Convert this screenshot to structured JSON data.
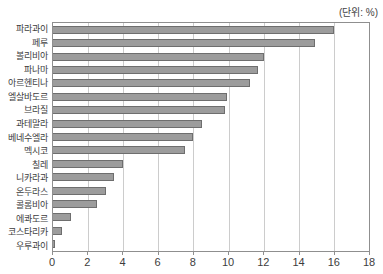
{
  "unit_label": "(단위: %)",
  "colors": {
    "bar_fill": "#9c9c9c",
    "bar_border": "#6e6e6e",
    "gridline": "#cccccc",
    "plot_border": "#8f8f8f",
    "text": "#3d3d3d"
  },
  "chart_data": {
    "type": "bar",
    "orientation": "horizontal",
    "title": "",
    "xlabel": "",
    "ylabel": "",
    "unit": "(단위: %)",
    "categories": [
      "파라과이",
      "페루",
      "볼리비아",
      "파나마",
      "아르헨티나",
      "엘살바도르",
      "브라질",
      "과테말라",
      "베네수엘라",
      "멕시코",
      "칠레",
      "니카라과",
      "온두라스",
      "콜롬비아",
      "에콰도르",
      "코스타리카",
      "우루과이"
    ],
    "values": [
      16.0,
      14.9,
      12.0,
      11.7,
      11.2,
      9.9,
      9.8,
      8.5,
      8.0,
      7.5,
      4.0,
      3.5,
      3.0,
      2.5,
      1.0,
      0.5,
      0.1
    ],
    "xlim": [
      0,
      18
    ],
    "x_ticks": [
      0,
      2,
      4,
      6,
      8,
      10,
      12,
      14,
      16,
      18
    ],
    "grid": "vertical",
    "legend": "none"
  }
}
